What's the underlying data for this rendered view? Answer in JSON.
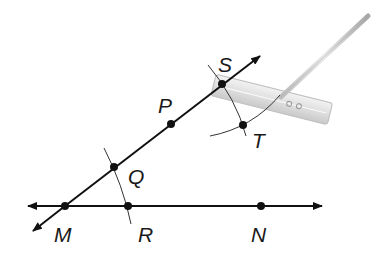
{
  "diagram": {
    "colors": {
      "line": "#111111",
      "arc": "#333333",
      "compass": "#c8c8c8"
    },
    "points": [
      {
        "id": "M",
        "label": "M",
        "x": 65,
        "y": 206,
        "lx": 54,
        "ly": 240
      },
      {
        "id": "R",
        "label": "R",
        "x": 128,
        "y": 206,
        "lx": 138,
        "ly": 240
      },
      {
        "id": "N",
        "label": "N",
        "x": 261,
        "y": 206,
        "lx": 251,
        "ly": 240
      },
      {
        "id": "Q",
        "label": "Q",
        "x": 114,
        "y": 167,
        "lx": 128,
        "ly": 183
      },
      {
        "id": "P",
        "label": "P",
        "x": 171,
        "y": 124,
        "lx": 158,
        "ly": 112
      },
      {
        "id": "S",
        "label": "S",
        "x": 222,
        "y": 84,
        "lx": 218,
        "ly": 70
      },
      {
        "id": "T",
        "label": "T",
        "x": 243,
        "y": 125,
        "lx": 250,
        "ly": 147
      }
    ],
    "labels": {
      "M": "M",
      "R": "R",
      "N": "N",
      "Q": "Q",
      "P": "P",
      "S": "S",
      "T": "T"
    }
  }
}
